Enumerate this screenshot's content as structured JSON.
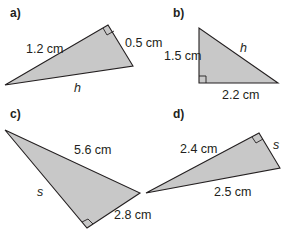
{
  "colors": {
    "fill": "#c8c8c8",
    "stroke": "#231f20",
    "background": "#ffffff"
  },
  "figures": [
    {
      "part": "a)",
      "labels": {
        "leg1": "1.2 cm",
        "leg2": "0.5 cm",
        "hyp": "h"
      },
      "unknown": "h"
    },
    {
      "part": "b)",
      "labels": {
        "leg1": "1.5 cm",
        "leg2": "2.2 cm",
        "hyp": "h"
      },
      "unknown": "h"
    },
    {
      "part": "c)",
      "labels": {
        "hyp": "5.6 cm",
        "leg1": "2.8 cm",
        "leg2": "s"
      },
      "unknown": "s"
    },
    {
      "part": "d)",
      "labels": {
        "leg1": "2.4 cm",
        "hyp": "2.5 cm",
        "leg2": "s"
      },
      "unknown": "s"
    }
  ]
}
